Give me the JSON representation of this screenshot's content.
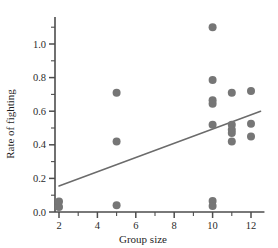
{
  "chart_data": {
    "type": "scatter",
    "title": "",
    "xlabel": "Group size",
    "ylabel": "Rate of fighting",
    "xlim": [
      1.6,
      12.7
    ],
    "ylim": [
      0.0,
      1.16
    ],
    "grid": false,
    "legend": null,
    "x_ticks_major": [
      2,
      4,
      6,
      8,
      10,
      12
    ],
    "x_ticks_major_labels": [
      "2",
      "4",
      "6",
      "8",
      "10",
      "12"
    ],
    "x_ticks_minor": [
      3,
      5,
      7,
      9,
      11
    ],
    "y_ticks_major": [
      0.0,
      0.2,
      0.4,
      0.6,
      0.8,
      1.0
    ],
    "y_ticks_major_labels": [
      "0.0",
      "0.2",
      "0.4",
      "0.6",
      "0.8",
      "1.0"
    ],
    "y_ticks_minor": [
      0.1,
      0.3,
      0.5,
      0.7,
      0.9,
      1.1
    ],
    "marker_color": "#767676",
    "line_color": "#6b6b6b",
    "axis_color": "#4d4d4d",
    "points": [
      {
        "x": 2,
        "y": 0.03
      },
      {
        "x": 2,
        "y": 0.062
      },
      {
        "x": 5,
        "y": 0.71
      },
      {
        "x": 5,
        "y": 0.42
      },
      {
        "x": 5,
        "y": 0.04
      },
      {
        "x": 10,
        "y": 1.1
      },
      {
        "x": 10,
        "y": 0.785
      },
      {
        "x": 10,
        "y": 0.665
      },
      {
        "x": 10,
        "y": 0.645
      },
      {
        "x": 10,
        "y": 0.52
      },
      {
        "x": 10,
        "y": 0.065
      },
      {
        "x": 10,
        "y": 0.035
      },
      {
        "x": 11,
        "y": 0.71
      },
      {
        "x": 11,
        "y": 0.52
      },
      {
        "x": 11,
        "y": 0.49
      },
      {
        "x": 11,
        "y": 0.47
      },
      {
        "x": 11,
        "y": 0.42
      },
      {
        "x": 12,
        "y": 0.72
      },
      {
        "x": 12,
        "y": 0.525
      },
      {
        "x": 12,
        "y": 0.45
      }
    ],
    "trendline": {
      "x_start": 2.0,
      "y_start": 0.155,
      "x_end": 12.5,
      "y_end": 0.6
    }
  }
}
